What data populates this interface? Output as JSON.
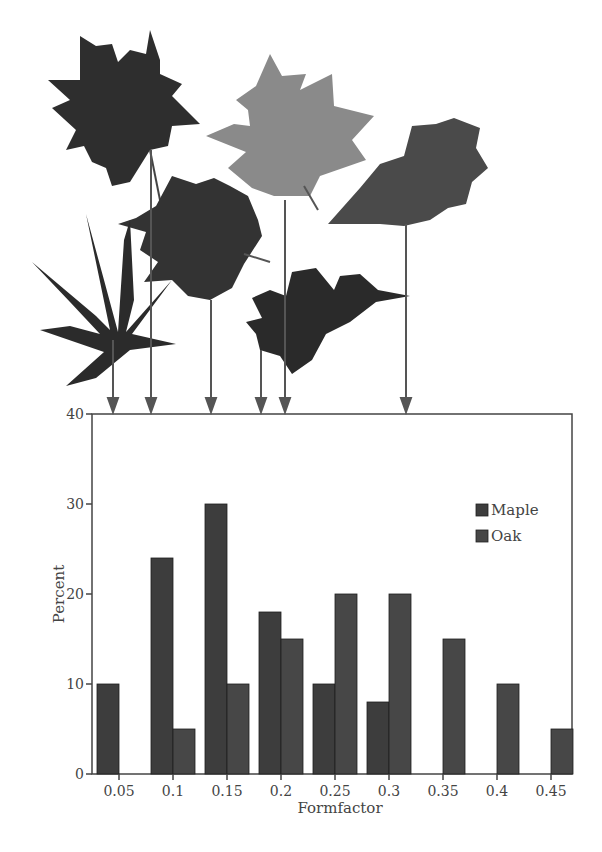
{
  "chart_data": {
    "type": "bar",
    "title": "",
    "xlabel": "Formfactor",
    "ylabel": "Percent",
    "ylim": [
      0,
      40
    ],
    "yticks": [
      0,
      10,
      20,
      30,
      40
    ],
    "categories": [
      "0.05",
      "0.1",
      "0.15",
      "0.2",
      "0.25",
      "0.3",
      "0.35",
      "0.4",
      "0.45"
    ],
    "series": [
      {
        "name": "Maple",
        "values": [
          10,
          24,
          30,
          18,
          10,
          8,
          0,
          0,
          0
        ],
        "color": "#3d3d3d"
      },
      {
        "name": "Oak",
        "values": [
          0,
          5,
          10,
          15,
          20,
          20,
          15,
          10,
          5
        ],
        "color": "#474747"
      }
    ],
    "legend_position": "upper right",
    "grid": false,
    "annotations": "Leaf images above chart with arrows pointing to formfactor positions (approx 0.045, 0.08, 0.135, 0.18, 0.2, 0.315)"
  },
  "legend": {
    "items": [
      {
        "label": "Maple"
      },
      {
        "label": "Oak"
      }
    ]
  },
  "axes": {
    "xlabel": "Formfactor",
    "ylabel": "Percent",
    "yticks": [
      "0",
      "10",
      "20",
      "30",
      "40"
    ],
    "xticks": [
      "0.05",
      "0.1",
      "0.15",
      "0.2",
      "0.25",
      "0.3",
      "0.35",
      "0.4",
      "0.45"
    ]
  }
}
